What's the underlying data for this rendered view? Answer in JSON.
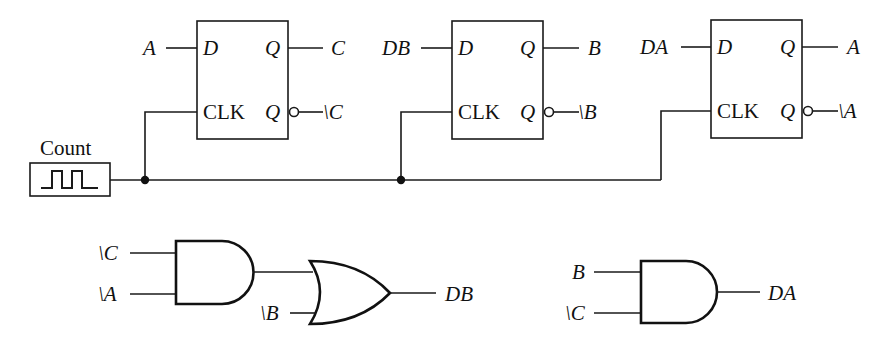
{
  "diagram": {
    "title": "",
    "clock_source": {
      "label": "Count",
      "icon": "square-wave-icon"
    },
    "flip_flops": [
      {
        "id": "ff-c",
        "d_pin": "D",
        "clk_pin": "CLK",
        "q_pin": "Q",
        "qbar_pin": "Q",
        "d_input": "A",
        "q_output": "C",
        "qbar_output": "\\C"
      },
      {
        "id": "ff-b",
        "d_pin": "D",
        "clk_pin": "CLK",
        "q_pin": "Q",
        "qbar_pin": "Q",
        "d_input": "DB",
        "q_output": "B",
        "qbar_output": "\\B"
      },
      {
        "id": "ff-a",
        "d_pin": "D",
        "clk_pin": "CLK",
        "q_pin": "Q",
        "qbar_pin": "Q",
        "d_input": "DA",
        "q_output": "A",
        "qbar_output": "\\A"
      }
    ],
    "logic": {
      "db_network": {
        "and_inputs": [
          "\\C",
          "\\A"
        ],
        "or_extra_input": "\\B",
        "output": "DB"
      },
      "da_network": {
        "and_inputs": [
          "B",
          "\\C"
        ],
        "output": "DA"
      }
    }
  }
}
